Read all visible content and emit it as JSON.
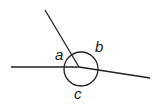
{
  "diagram": {
    "type": "angles at a point",
    "labels": {
      "a": "a",
      "b": "b",
      "c": "c"
    },
    "stroke_color": "#222222"
  }
}
